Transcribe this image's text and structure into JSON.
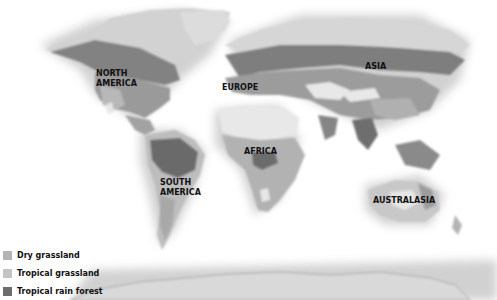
{
  "map": {
    "type": "world-biome-map",
    "colors": {
      "ocean": "#ffffff",
      "ice_land": "#d6d6d6",
      "desert": "#e9e9e9",
      "dry_grassland": "#b4b4b4",
      "tropical_grassland": "#c4c4c4",
      "tropical_rain_forest": "#6d6d6d",
      "forest": "#8e8e8e"
    },
    "regions": [
      {
        "id": "north-america",
        "label": "NORTH\nAMERICA",
        "line1": "NORTH",
        "line2": "AMERICA"
      },
      {
        "id": "europe",
        "label": "EUROPE"
      },
      {
        "id": "asia",
        "label": "ASIA"
      },
      {
        "id": "africa",
        "label": "AFRICA"
      },
      {
        "id": "south-america",
        "label": "SOUTH\nAMERICA",
        "line1": "SOUTH",
        "line2": "AMERICA"
      },
      {
        "id": "australasia",
        "label": "AUSTRALASIA"
      }
    ]
  },
  "legend": {
    "items": [
      {
        "label": "Dry grassland",
        "color": "#b4b4b4"
      },
      {
        "label": "Tropical grassland",
        "color": "#c4c4c4"
      },
      {
        "label": "Tropical rain forest",
        "color": "#6d6d6d"
      }
    ]
  }
}
